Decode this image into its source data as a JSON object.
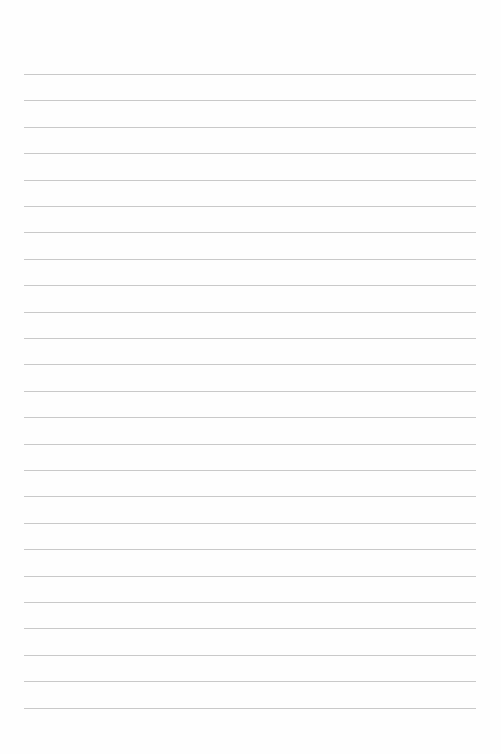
{
  "page": {
    "type": "lined-paper",
    "background_color": "#fefefe",
    "line_color": "#c9c9c9",
    "line_count": 25,
    "first_line_y": 74,
    "line_spacing": 26.4,
    "line_left": 24,
    "line_right": 476
  }
}
